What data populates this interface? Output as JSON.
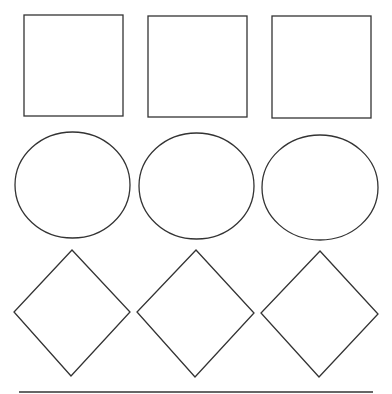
{
  "canvas": {
    "width": 392,
    "height": 394,
    "background": "#ffffff",
    "stroke": "#333333"
  },
  "rows": [
    {
      "shape": "square",
      "items": [
        {
          "x": 24,
          "y": 15,
          "w": 99,
          "h": 101
        },
        {
          "x": 148,
          "y": 16,
          "w": 99,
          "h": 101
        },
        {
          "x": 272,
          "y": 16,
          "w": 99,
          "h": 102
        }
      ]
    },
    {
      "shape": "ellipse",
      "items": [
        {
          "cx": 72.5,
          "cy": 185,
          "rx": 57.5,
          "ry": 53
        },
        {
          "cx": 196.5,
          "cy": 186,
          "rx": 57.5,
          "ry": 53
        },
        {
          "cx": 320,
          "cy": 187.5,
          "rx": 58,
          "ry": 52.5
        }
      ]
    },
    {
      "shape": "diamond",
      "items": [
        {
          "points": "72,250 130,312 71,376 14,312"
        },
        {
          "points": "196,250 254,313 195,377 137,312"
        },
        {
          "points": "320,251 378,314 319,377 261,313"
        }
      ]
    }
  ],
  "baseline": {
    "x1": 19,
    "y1": 392,
    "x2": 373,
    "y2": 392
  }
}
